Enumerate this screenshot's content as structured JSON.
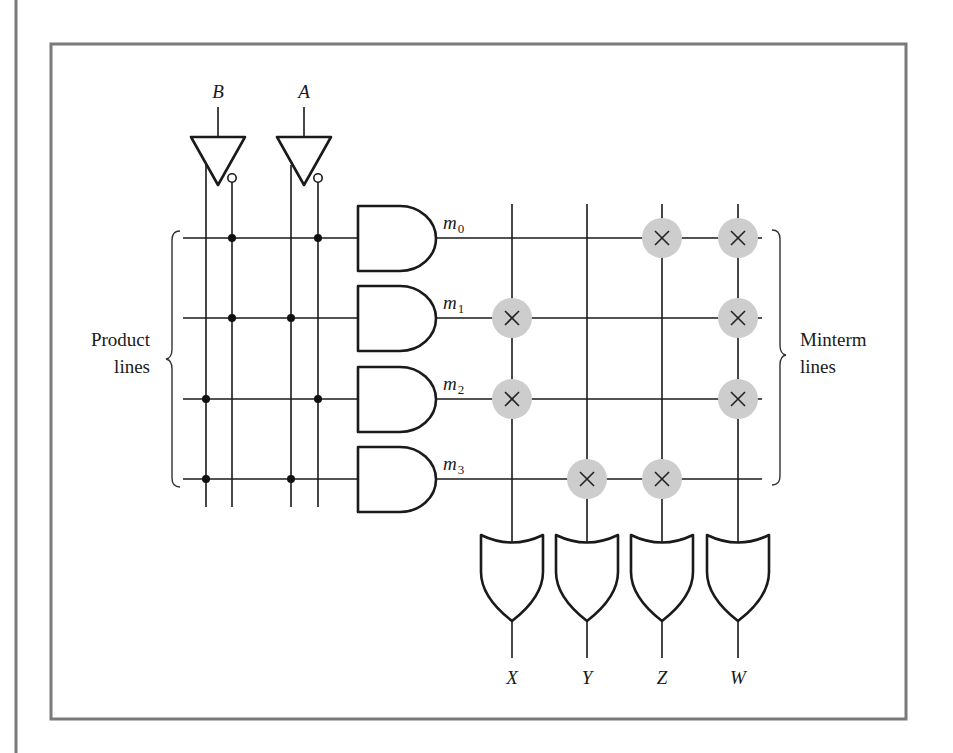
{
  "figure": {
    "inputs": [
      {
        "id": "B",
        "label": "B",
        "x": 218
      },
      {
        "id": "A",
        "label": "A",
        "x": 304
      }
    ],
    "input_lines": [
      {
        "name": "B",
        "x": 206,
        "inverted": false
      },
      {
        "name": "B'",
        "x": 232,
        "inverted": true
      },
      {
        "name": "A",
        "x": 291,
        "inverted": false
      },
      {
        "name": "A'",
        "x": 318,
        "inverted": true
      }
    ],
    "minterms": [
      {
        "label": "m",
        "sub": "0",
        "y": 238,
        "connections": [
          "B'",
          "A'"
        ],
        "or_crosspoints": [
          "Z",
          "W"
        ]
      },
      {
        "label": "m",
        "sub": "1",
        "y": 318,
        "connections": [
          "B'",
          "A"
        ],
        "or_crosspoints": [
          "X",
          "W"
        ]
      },
      {
        "label": "m",
        "sub": "2",
        "y": 399,
        "connections": [
          "B",
          "A'"
        ],
        "or_crosspoints": [
          "X",
          "W"
        ]
      },
      {
        "label": "m",
        "sub": "3",
        "y": 479,
        "connections": [
          "B",
          "A"
        ],
        "or_crosspoints": [
          "Y",
          "Z"
        ]
      }
    ],
    "outputs": [
      {
        "label": "X",
        "x": 512
      },
      {
        "label": "Y",
        "x": 587
      },
      {
        "label": "Z",
        "x": 662
      },
      {
        "label": "W",
        "x": 738
      }
    ],
    "annotations": {
      "product_lines": [
        "Product",
        "lines"
      ],
      "minterm_lines": [
        "Minterm",
        "lines"
      ]
    },
    "colors": {
      "line": "#1a1a1a",
      "frame": "#7a7a7a",
      "crosspoint_fill": "#cdcdcd"
    }
  }
}
